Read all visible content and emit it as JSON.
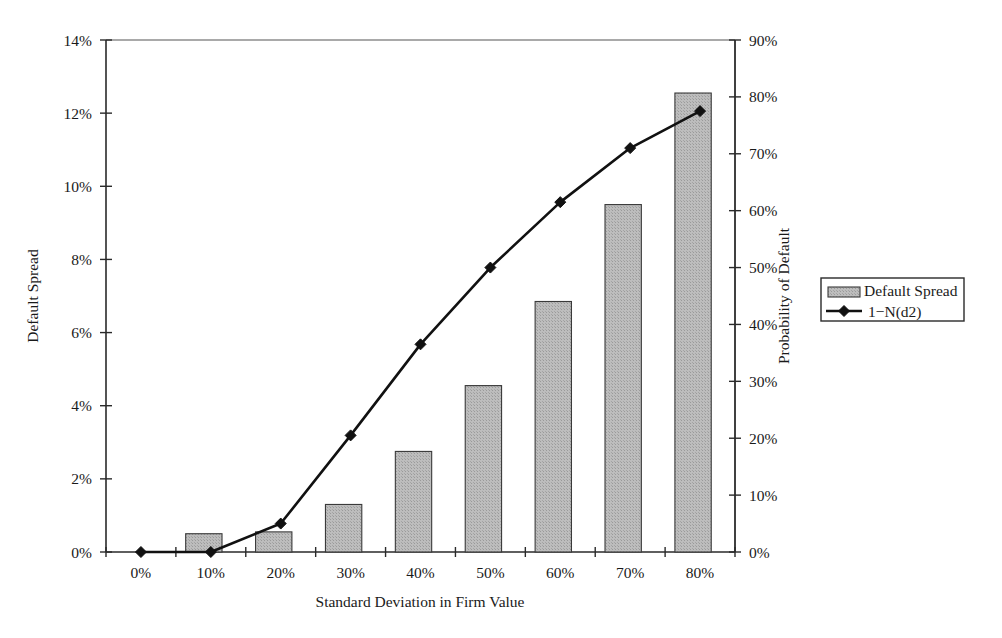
{
  "chart_data": {
    "type": "bar",
    "title": "",
    "subtitle": "",
    "xlabel": "Standard Deviation in Firm Value",
    "ylabel": "Default Spread",
    "y2label": "Probability of Default",
    "categories": [
      "0%",
      "10%",
      "20%",
      "30%",
      "40%",
      "50%",
      "60%",
      "70%",
      "80%"
    ],
    "x_values": [
      0,
      10,
      20,
      30,
      40,
      50,
      60,
      70,
      80
    ],
    "x_tick_labels": [
      "0%",
      "10%",
      "20%",
      "30%",
      "40%",
      "50%",
      "60%",
      "70%",
      "80%"
    ],
    "ylim": [
      0,
      14
    ],
    "y_tick_labels": [
      "0%",
      "2%",
      "4%",
      "6%",
      "8%",
      "10%",
      "12%",
      "14%"
    ],
    "y_tick_values": [
      0,
      2,
      4,
      6,
      8,
      10,
      12,
      14
    ],
    "y2lim": [
      0,
      90
    ],
    "y2_tick_labels": [
      "0%",
      "10%",
      "20%",
      "30%",
      "40%",
      "50%",
      "60%",
      "70%",
      "80%",
      "90%"
    ],
    "y2_tick_values": [
      0,
      10,
      20,
      30,
      40,
      50,
      60,
      70,
      80,
      90
    ],
    "grid": false,
    "legend_position": "right",
    "series": [
      {
        "name": "Default Spread",
        "kind": "bar",
        "axis": "left",
        "values": [
          0,
          0.5,
          0.55,
          1.3,
          2.75,
          4.55,
          6.85,
          9.5,
          12.55
        ],
        "fill_color": "#b8b8b8",
        "edge_color": "#3a3a3a"
      },
      {
        "name": "1−N(d2)",
        "kind": "line",
        "axis": "right",
        "values": [
          0,
          0,
          5,
          20.5,
          36.5,
          50,
          61.5,
          71,
          77.5
        ],
        "line_color": "#111111",
        "marker": "diamond"
      }
    ]
  },
  "legend": {
    "entries": [
      {
        "label": "Default Spread",
        "type": "swatch"
      },
      {
        "label": "1−N(d2)",
        "type": "line-marker"
      }
    ]
  },
  "axes": {
    "left_title": "Default Spread",
    "right_title": "Probability of Default",
    "bottom_title": "Standard Deviation in Firm Value"
  },
  "colors": {
    "bar_fill": "#b8b8b8",
    "bar_edge": "#3a3a3a",
    "line": "#111111",
    "axis": "#2a2a2a",
    "background": "#ffffff"
  }
}
